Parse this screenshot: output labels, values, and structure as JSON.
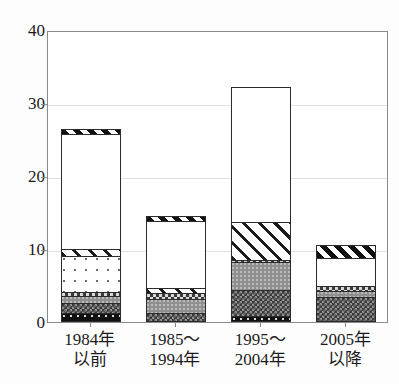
{
  "chart_data": {
    "type": "bar",
    "subtype": "stacked",
    "title": "",
    "xlabel": "",
    "ylabel": "",
    "ylim": [
      0,
      40
    ],
    "yticks": [
      0,
      10,
      20,
      30,
      40
    ],
    "grid": true,
    "legend": "none",
    "categories": [
      "1984年\n以前",
      "1985～\n1994年",
      "1995～\n2004年",
      "2005年\n以降"
    ],
    "category_lines": [
      [
        "1984年",
        "以前"
      ],
      [
        "1985～",
        "1994年"
      ],
      [
        "1995～",
        "2004年"
      ],
      [
        "2005年",
        "以降"
      ]
    ],
    "series": [
      {
        "name": "black-dotted",
        "pattern": "p-blackdot",
        "values": [
          1.0,
          0.0,
          0.6,
          0.0
        ]
      },
      {
        "name": "dark-checkered",
        "pattern": "p-darkcheck",
        "values": [
          1.4,
          1.0,
          3.6,
          3.2
        ]
      },
      {
        "name": "gray-solid",
        "pattern": "p-gray",
        "values": [
          0.9,
          2.0,
          3.8,
          0.9
        ]
      },
      {
        "name": "light-checkered",
        "pattern": "p-lightcheck",
        "values": [
          0.6,
          0.7,
          0.3,
          0.7
        ]
      },
      {
        "name": "fine-dotted",
        "pattern": "p-finedot",
        "values": [
          5.0,
          0.0,
          0.0,
          0.0
        ]
      },
      {
        "name": "diagonal-hatch",
        "pattern": "p-hatch",
        "values": [
          0.9,
          0.7,
          5.2,
          0.0
        ]
      },
      {
        "name": "vertical-dash",
        "pattern": "p-vdash",
        "values": [
          16.0,
          9.4,
          18.7,
          3.9
        ]
      },
      {
        "name": "black-hatch-cap",
        "pattern": "p-blackhatch",
        "values": [
          0.6,
          0.7,
          0.0,
          1.8
        ]
      }
    ],
    "totals": [
      26.4,
      14.5,
      32.2,
      10.5
    ]
  },
  "axis": {
    "y_tick_labels": [
      "0",
      "10",
      "20",
      "30",
      "40"
    ]
  }
}
